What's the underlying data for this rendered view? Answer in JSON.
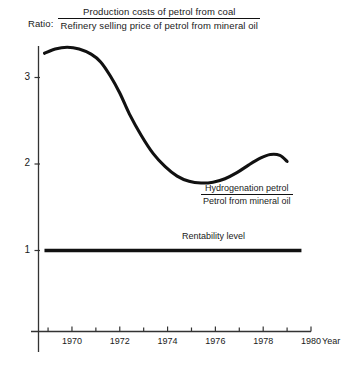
{
  "chart_data": {
    "type": "line",
    "title_prefix": "Ratio:",
    "title_numerator": "Production costs of petrol from coal",
    "title_denominator": "Refinery selling price of petrol from mineral oil",
    "xlabel": "Year",
    "ylabel": "",
    "xlim": [
      1968.6,
      1980
    ],
    "ylim": [
      0.35,
      3.6
    ],
    "grid": false,
    "legend_position": "inline-annotation",
    "xticks": [
      1970,
      1972,
      1974,
      1976,
      1978,
      1980
    ],
    "xtick_labels": [
      "1970",
      "1972",
      "1974",
      "1976",
      "1978",
      "1980"
    ],
    "xminor_ticks": [
      1969,
      1971,
      1973,
      1975,
      1977,
      1979
    ],
    "yticks": [
      1,
      2,
      3
    ],
    "ytick_labels": [
      "1",
      "2",
      "3"
    ],
    "series": [
      {
        "name": "Hydrogenation petrol / Petrol from mineral oil",
        "annotation_numerator": "Hydrogenation petrol",
        "annotation_denominator": "Petrol from mineral oil",
        "x": [
          1968.85,
          1969.3,
          1969.8,
          1970.3,
          1970.8,
          1971.2,
          1971.6,
          1972.0,
          1972.4,
          1972.9,
          1973.4,
          1973.9,
          1974.4,
          1974.9,
          1975.4,
          1975.9,
          1976.4,
          1976.9,
          1977.4,
          1977.9,
          1978.3,
          1978.7,
          1979.0
        ],
        "y": [
          3.28,
          3.33,
          3.35,
          3.33,
          3.27,
          3.18,
          3.02,
          2.82,
          2.58,
          2.33,
          2.12,
          1.97,
          1.86,
          1.8,
          1.78,
          1.79,
          1.83,
          1.9,
          1.99,
          2.07,
          2.11,
          2.1,
          2.03
        ]
      },
      {
        "name": "Rentability level",
        "annotation": "Rentability level",
        "x": [
          1968.85,
          1979.6
        ],
        "y": [
          1.0,
          1.0
        ],
        "style": "thick-horizontal"
      }
    ]
  },
  "colors": {
    "line": "#111111",
    "axis": "#333333",
    "background": "#ffffff",
    "text": "#1a1a1a"
  }
}
